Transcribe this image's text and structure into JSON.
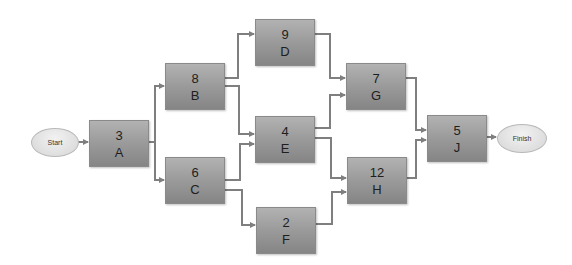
{
  "diagram": {
    "type": "activity-on-node network",
    "start_label": "Start",
    "finish_label": "Finish",
    "nodes": [
      {
        "id": "A",
        "duration": "3"
      },
      {
        "id": "B",
        "duration": "8"
      },
      {
        "id": "C",
        "duration": "6"
      },
      {
        "id": "D",
        "duration": "9"
      },
      {
        "id": "E",
        "duration": "4"
      },
      {
        "id": "F",
        "duration": "2"
      },
      {
        "id": "G",
        "duration": "7"
      },
      {
        "id": "H",
        "duration": "12"
      },
      {
        "id": "J",
        "duration": "5"
      }
    ],
    "edges": [
      [
        "Start",
        "A"
      ],
      [
        "A",
        "B"
      ],
      [
        "A",
        "C"
      ],
      [
        "B",
        "D"
      ],
      [
        "B",
        "E"
      ],
      [
        "C",
        "E"
      ],
      [
        "C",
        "F"
      ],
      [
        "D",
        "G"
      ],
      [
        "E",
        "G"
      ],
      [
        "E",
        "H"
      ],
      [
        "F",
        "H"
      ],
      [
        "G",
        "J"
      ],
      [
        "H",
        "J"
      ],
      [
        "J",
        "Finish"
      ]
    ]
  },
  "colors": {
    "node_fill": "#9a9a9a",
    "arrow": "#7f7f7f",
    "terminal_fill": "#e2e2e2"
  }
}
